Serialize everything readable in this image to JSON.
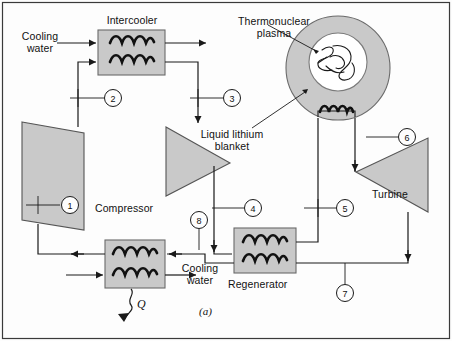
{
  "figure": {
    "caption": "(a)",
    "heat_symbol": "Q",
    "components": [
      {
        "name": "intercooler",
        "label": "Intercooler"
      },
      {
        "name": "compressor",
        "label": "Compressor"
      },
      {
        "name": "regenerator",
        "label": "Regenerator"
      },
      {
        "name": "turbine",
        "label": "Turbine"
      },
      {
        "name": "thermonuclear-plasma",
        "label": "Thermonuclear\nplasma"
      },
      {
        "name": "liquid-lithium-blanket",
        "label": "Liquid lithium\nblanket"
      }
    ],
    "flow_labels": [
      {
        "name": "cooling-water-top",
        "label": "Cooling\nwater"
      },
      {
        "name": "cooling-water-bottom",
        "label": "Cooling\nwater"
      }
    ],
    "state_points": [
      "1",
      "2",
      "3",
      "4",
      "5",
      "6",
      "7",
      "8"
    ],
    "colors": {
      "component_fill": "#c9c9c9",
      "component_stroke": "#555555",
      "reactor_outer_fill": "#c9c9c9",
      "reactor_inner_fill": "#ffffff",
      "line": "#1a1a1a",
      "text": "#111111",
      "background": "#fdfdfd",
      "border": "#333333"
    }
  }
}
